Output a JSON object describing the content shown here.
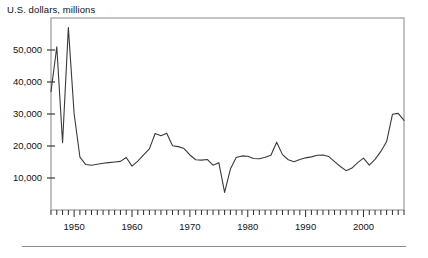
{
  "figure": {
    "title": "U.S. dollars, millions",
    "bottom_rule": "horizontal-rule"
  },
  "chart_data": {
    "type": "line",
    "title": "U.S. dollars, millions",
    "xlabel": "",
    "ylabel": "U.S. dollars, millions",
    "xlim": [
      1946,
      2007
    ],
    "ylim": [
      0,
      60000
    ],
    "grid": false,
    "legend": "none",
    "line_color": "#3a3a3a",
    "axis_color": "#9a9a9a",
    "y_ticks": [
      10000,
      20000,
      30000,
      40000,
      50000
    ],
    "y_tick_labels": [
      "10,000",
      "20,000",
      "30,000",
      "40,000",
      "50,000"
    ],
    "x_ticks": [
      1950,
      1960,
      1970,
      1980,
      1990,
      2000
    ],
    "x_tick_labels": [
      "1950",
      "1960",
      "1970",
      "1980",
      "1990",
      "2000"
    ],
    "x_minor_tick_interval": 1,
    "x": [
      1946,
      1947,
      1948,
      1949,
      1950,
      1951,
      1952,
      1953,
      1954,
      1955,
      1956,
      1957,
      1958,
      1959,
      1960,
      1961,
      1962,
      1963,
      1964,
      1965,
      1966,
      1967,
      1968,
      1969,
      1970,
      1971,
      1972,
      1973,
      1974,
      1975,
      1976,
      1977,
      1978,
      1979,
      1980,
      1981,
      1982,
      1983,
      1984,
      1985,
      1986,
      1987,
      1988,
      1989,
      1990,
      1991,
      1992,
      1993,
      1994,
      1995,
      1996,
      1997,
      1998,
      1999,
      2000,
      2001,
      2002,
      2003,
      2004,
      2005,
      2006,
      2007
    ],
    "values": [
      37000,
      51000,
      21000,
      57000,
      30000,
      16500,
      14200,
      14000,
      14300,
      14600,
      14800,
      15000,
      15200,
      16400,
      13700,
      15300,
      17200,
      19100,
      23900,
      23200,
      24000,
      20100,
      19800,
      19200,
      17200,
      15700,
      15600,
      15800,
      14000,
      14800,
      5500,
      12800,
      16400,
      16900,
      16800,
      16100,
      16000,
      16500,
      17100,
      21200,
      17300,
      15700,
      15100,
      15800,
      16300,
      16600,
      17100,
      17200,
      16700,
      15100,
      13600,
      12300,
      13100,
      14800,
      16200,
      14000,
      15800,
      18300,
      21400,
      29900,
      30200,
      28000
    ],
    "series_name": "U.S. dollars, millions",
    "annotations": []
  }
}
